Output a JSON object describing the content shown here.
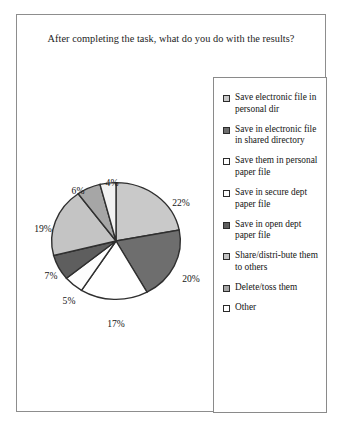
{
  "figure": {
    "title": "After completing the task, what do you do with the results?"
  },
  "chart_data": {
    "type": "pie",
    "title": "After completing the task, what do you do with the results?",
    "xlabel": "",
    "ylabel": "",
    "legend_position": "right",
    "grid": false,
    "start_angle_deg": 0,
    "direction": "clockwise",
    "categories": [
      "Save electronic file in personal dir",
      "Save in electronic file in shared directory",
      "Save them in personal paper file",
      "Save in secure dept paper file",
      "Save in open dept paper file",
      "Share/distribute them to others",
      "Delete/toss them",
      "Other"
    ],
    "values": [
      22,
      20,
      17,
      5,
      7,
      19,
      6,
      4
    ],
    "data_labels": [
      "22%",
      "20%",
      "17%",
      "5%",
      "7%",
      "19%",
      "6%",
      "4%"
    ],
    "colors": [
      "#c9c9c9",
      "#6e6e6e",
      "#ffffff",
      "#fdfdfd",
      "#5e5e5e",
      "#c4c4c4",
      "#a6a6a6",
      "#f2f2f2"
    ],
    "slice_edge_color": "#2f2f2f"
  },
  "legend": {
    "entries": [
      {
        "label": "Save electronic file in personal dir",
        "swatch": "#c9c9c9",
        "value": "22%"
      },
      {
        "label": "Save in electronic file in shared directory",
        "swatch": "#6e6e6e",
        "value": "20%"
      },
      {
        "label": "Save them in personal paper file",
        "swatch": "#ffffff",
        "value": "17%"
      },
      {
        "label": "Save in secure dept paper file",
        "swatch": "#fdfdfd",
        "value": "5%"
      },
      {
        "label": "Save in open dept paper file",
        "swatch": "#5e5e5e",
        "value": "7%"
      },
      {
        "label": "Share/distri-bute them to others",
        "swatch": "#c4c4c4",
        "value": "19%"
      },
      {
        "label": "Delete/toss them",
        "swatch": "#a6a6a6",
        "value": "6%"
      },
      {
        "label": "Other",
        "swatch": "#ffffff",
        "value": "4%"
      }
    ]
  },
  "pie_labels": [
    {
      "text": "22%",
      "x": 152,
      "y": 42
    },
    {
      "text": "20%",
      "x": 162,
      "y": 118
    },
    {
      "text": "17%",
      "x": 87,
      "y": 163
    },
    {
      "text": "5%",
      "x": 40,
      "y": 140
    },
    {
      "text": "7%",
      "x": 22,
      "y": 115
    },
    {
      "text": "19%",
      "x": 14,
      "y": 68
    },
    {
      "text": "6%",
      "x": 49,
      "y": 30
    },
    {
      "text": "4%",
      "x": 83,
      "y": 22
    }
  ]
}
